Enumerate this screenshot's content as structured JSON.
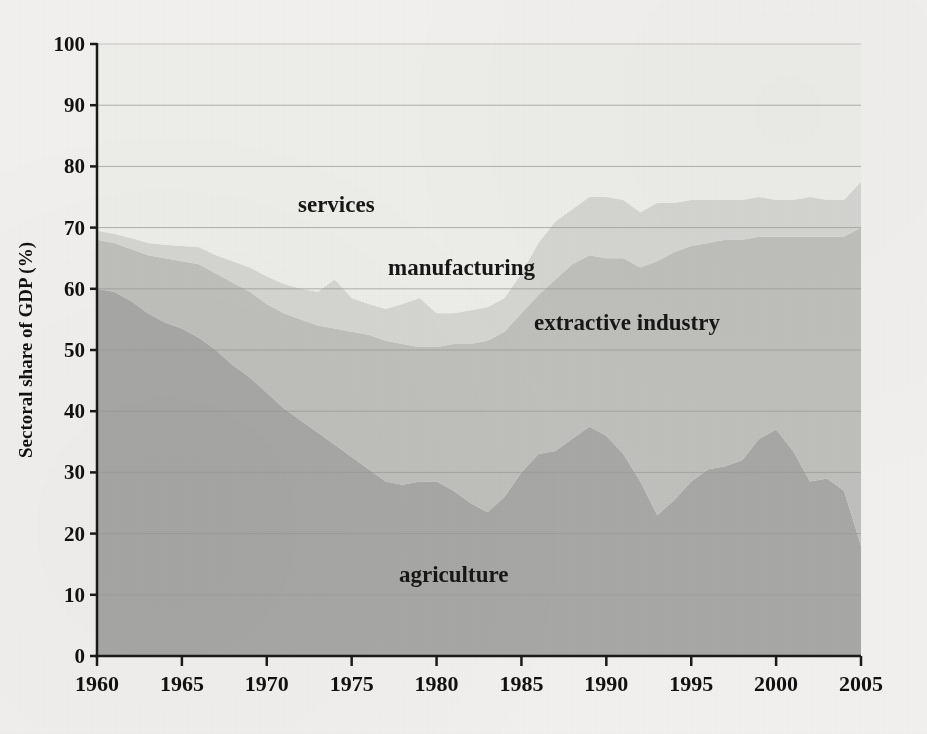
{
  "figure": {
    "background_color": "#f3f1ef",
    "plot_background_color": "#efefec"
  },
  "axes": {
    "y_title": "Sectoral share of GDP (%)",
    "x_title": "",
    "y_ticks": [
      "0",
      "10",
      "20",
      "30",
      "40",
      "50",
      "60",
      "70",
      "80",
      "90",
      "100"
    ],
    "x_ticks": [
      "1960",
      "1965",
      "1970",
      "1975",
      "1980",
      "1985",
      "1990",
      "1995",
      "2000",
      "2005"
    ],
    "axis_color": "#1a1a1a",
    "grid_color": "#9a9a96"
  },
  "series_labels": {
    "services": "services",
    "manufacturing": "manufacturing",
    "extractive": "extractive industry",
    "agriculture": "agriculture"
  },
  "chart_data": {
    "type": "area",
    "stacked": true,
    "title": "",
    "xlabel": "",
    "ylabel": "Sectoral share of GDP (%)",
    "xlim": [
      1960,
      2005
    ],
    "ylim": [
      0,
      100
    ],
    "grid": true,
    "legend": "inline-labels",
    "colors": {
      "agriculture": "#a8a8a6",
      "extractive": "#c0c0bd",
      "manufacturing": "#d6d6d3",
      "services": "#eeeeea"
    },
    "x": [
      1960,
      1961,
      1962,
      1963,
      1964,
      1965,
      1966,
      1967,
      1968,
      1969,
      1970,
      1971,
      1972,
      1973,
      1974,
      1975,
      1976,
      1977,
      1978,
      1979,
      1980,
      1981,
      1982,
      1983,
      1984,
      1985,
      1986,
      1987,
      1988,
      1989,
      1990,
      1991,
      1992,
      1993,
      1994,
      1995,
      1996,
      1997,
      1998,
      1999,
      2000,
      2001,
      2002,
      2003,
      2004,
      2005
    ],
    "series": [
      {
        "name": "agriculture",
        "values": [
          60.0,
          59.5,
          58.0,
          56.0,
          54.5,
          53.5,
          52.0,
          50.0,
          47.5,
          45.5,
          43.0,
          40.5,
          38.5,
          36.5,
          34.5,
          32.5,
          30.5,
          28.5,
          28.0,
          28.5,
          28.5,
          27.0,
          25.0,
          23.5,
          26.0,
          30.0,
          33.0,
          33.5,
          35.5,
          37.5,
          36.0,
          33.0,
          28.5,
          23.0,
          25.5,
          28.5,
          30.5,
          31.0,
          32.0,
          35.5,
          37.0,
          33.5,
          28.5,
          29.0,
          27.0,
          18.0
        ]
      },
      {
        "name": "extractive",
        "values": [
          8.0,
          8.0,
          8.5,
          9.5,
          10.5,
          11.0,
          12.0,
          12.5,
          13.5,
          14.0,
          14.5,
          15.5,
          16.5,
          17.5,
          19.0,
          20.5,
          22.0,
          23.0,
          23.0,
          22.0,
          22.0,
          24.0,
          26.0,
          28.0,
          27.0,
          26.0,
          26.0,
          28.0,
          28.5,
          28.0,
          29.0,
          32.0,
          35.0,
          41.5,
          40.5,
          38.5,
          37.0,
          37.0,
          36.0,
          33.0,
          31.5,
          35.0,
          40.0,
          39.5,
          41.5,
          52.0
        ]
      },
      {
        "name": "manufacturing",
        "values": [
          1.5,
          1.5,
          1.8,
          2.0,
          2.2,
          2.5,
          2.8,
          3.0,
          3.5,
          4.0,
          4.5,
          4.8,
          5.0,
          5.5,
          8.0,
          5.5,
          5.0,
          5.2,
          6.5,
          8.0,
          5.5,
          5.0,
          5.5,
          5.5,
          5.5,
          6.5,
          8.5,
          9.5,
          9.0,
          9.5,
          10.0,
          9.5,
          9.0,
          9.5,
          8.0,
          7.5,
          7.0,
          6.5,
          6.5,
          6.5,
          6.0,
          6.0,
          6.5,
          6.0,
          6.0,
          7.5
        ]
      },
      {
        "name": "services",
        "values": [
          30.5,
          31.0,
          31.7,
          32.5,
          32.8,
          33.0,
          33.2,
          34.5,
          35.5,
          36.5,
          38.0,
          39.2,
          40.0,
          40.5,
          38.5,
          41.5,
          42.5,
          43.3,
          42.5,
          41.5,
          44.0,
          44.0,
          43.5,
          43.0,
          41.5,
          37.5,
          32.5,
          29.0,
          27.0,
          25.0,
          25.0,
          25.5,
          27.5,
          26.0,
          26.0,
          25.5,
          25.5,
          25.5,
          25.5,
          25.0,
          25.5,
          25.5,
          25.0,
          25.5,
          25.5,
          22.5
        ]
      }
    ],
    "cumulative_top_notes": {
      "agriculture_top_1960": 60,
      "extractive_top_1960": 68,
      "manufacturing_top_1960": 69.5,
      "total_top_1960": 100
    }
  }
}
